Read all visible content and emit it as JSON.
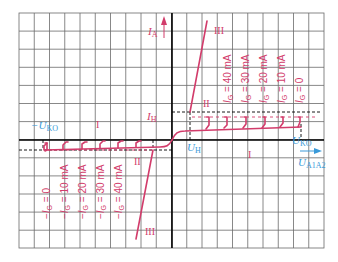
{
  "diagram": {
    "colors": {
      "grid": "#6a6a6a",
      "axis": "#000000",
      "curve": "#d23c6b",
      "voltage_label": "#3a9ad9",
      "current_label": "#d23c6b",
      "background": "#ffffff"
    },
    "axes": {
      "y_label": "I",
      "y_label_sub": "A",
      "x_label": "U",
      "x_label_sub": "A1A2",
      "pos_breakover_label": "U",
      "pos_breakover_sub": "KO",
      "neg_breakover_label": "−U",
      "neg_breakover_sub": "KO",
      "holding_current_label": "I",
      "holding_current_sub": "H",
      "holding_voltage_label": "U",
      "holding_voltage_sub": "H"
    },
    "regions": {
      "upper_I": "I",
      "upper_II": "II",
      "upper_III": "III",
      "lower_I": "I",
      "lower_II": "II",
      "lower_III": "III"
    },
    "gate_currents_positive": [
      "I_G = 40 mA",
      "I_G = 30 mA",
      "I_G = 20 mA",
      "I_G = 10 mA",
      "I_G = 0"
    ],
    "gate_currents_negative": [
      "−I_G = 0",
      "−I_G = 10 mA",
      "−I_G = 20 mA",
      "−I_G = 30 mA",
      "−I_G = 40 mA"
    ],
    "gate_labels_positive": [
      {
        "pre": "",
        "sym": "I",
        "sub": "G",
        "post": " = 40 mA"
      },
      {
        "pre": "",
        "sym": "I",
        "sub": "G",
        "post": " = 30 mA"
      },
      {
        "pre": "",
        "sym": "I",
        "sub": "G",
        "post": " = 20 mA"
      },
      {
        "pre": "",
        "sym": "I",
        "sub": "G",
        "post": " = 10 mA"
      },
      {
        "pre": "",
        "sym": "I",
        "sub": "G",
        "post": " = 0"
      }
    ],
    "gate_labels_negative": [
      {
        "pre": "−",
        "sym": "I",
        "sub": "G",
        "post": " = 0"
      },
      {
        "pre": "−",
        "sym": "I",
        "sub": "G",
        "post": " = 10 mA"
      },
      {
        "pre": "−",
        "sym": "I",
        "sub": "G",
        "post": " = 20 mA"
      },
      {
        "pre": "−",
        "sym": "I",
        "sub": "G",
        "post": " = 30 mA"
      },
      {
        "pre": "−",
        "sym": "I",
        "sub": "G",
        "post": " = 40 mA"
      }
    ]
  }
}
